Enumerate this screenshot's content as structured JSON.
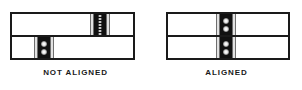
{
  "figure": {
    "panels": [
      {
        "id": "not-aligned",
        "caption": "NOT ALIGNED",
        "upper_strip": {
          "band_label": "registration-band",
          "band_offset_px": 78,
          "dot_count": 7,
          "dot_style": "fine"
        },
        "lower_strip": {
          "band_label": "registration-band",
          "band_offset_px": 22,
          "dot_count": 2,
          "dot_style": "coarse"
        }
      },
      {
        "id": "aligned",
        "caption": "ALIGNED",
        "upper_strip": {
          "band_label": "registration-band",
          "band_offset_px": 48,
          "dot_count": 2,
          "dot_style": "coarse"
        },
        "lower_strip": {
          "band_label": "registration-band",
          "band_offset_px": 48,
          "dot_count": 2,
          "dot_style": "coarse"
        }
      }
    ],
    "colors": {
      "outline": "#1a1a1a",
      "band_core": "#111111",
      "band_guard": "#e2e2e2",
      "background": "#ffffff"
    }
  }
}
